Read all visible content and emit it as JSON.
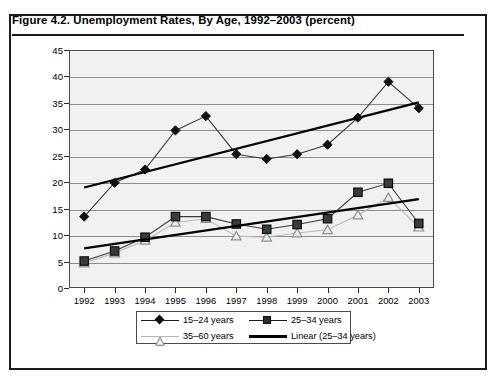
{
  "figure": {
    "caption": "Figure 4.2.  Unemployment Rates, By Age, 1992–2003 (percent)"
  },
  "chart_data": {
    "type": "line",
    "title": "Unemployment Rates, By Age, 1992–2003 (percent)",
    "xlabel": "",
    "ylabel": "",
    "ylim": [
      0,
      45
    ],
    "ytick_step": 5,
    "yticks": [
      0,
      5,
      10,
      15,
      20,
      25,
      30,
      35,
      40,
      45
    ],
    "grid": true,
    "legend_position": "bottom",
    "categories": [
      "1992",
      "1993",
      "1994",
      "1995",
      "1996",
      "1997",
      "1998",
      "1999",
      "2000",
      "2001",
      "2002",
      "2003"
    ],
    "series": [
      {
        "name": "15–24 years",
        "marker": "diamond",
        "color": "#111111",
        "values": [
          13.5,
          19.9,
          22.4,
          29.8,
          32.5,
          25.3,
          24.4,
          25.3,
          27.1,
          32.2,
          39.0,
          34.0
        ]
      },
      {
        "name": "25–34 years",
        "marker": "square",
        "color": "#2b2b2b",
        "values": [
          5.1,
          7.0,
          9.6,
          13.5,
          13.5,
          12.1,
          11.1,
          12.0,
          13.1,
          18.1,
          19.8,
          12.2
        ]
      },
      {
        "name": "35–60 years",
        "marker": "triangle",
        "color": "#b4b4b4",
        "values": [
          4.7,
          6.6,
          9.0,
          12.4,
          13.1,
          9.8,
          9.6,
          10.4,
          11.0,
          13.8,
          17.1,
          11.5
        ]
      },
      {
        "name": "Linear (25–34 years)",
        "marker": "none",
        "color": "#000000",
        "trendlines": [
          {
            "label": "upper",
            "start": 19.0,
            "end": 35.1
          },
          {
            "label": "lower",
            "start": 7.5,
            "end": 16.8
          }
        ]
      }
    ],
    "legend": [
      {
        "label": "15–24 years",
        "marker": "diamond"
      },
      {
        "label": "25–34 years",
        "marker": "square"
      },
      {
        "label": "35–60 years",
        "marker": "triangle"
      },
      {
        "label": "Linear (25–34 years)",
        "marker": "line"
      }
    ],
    "colors": {
      "plot_background": "#f2f1ef",
      "gridline": "#8d8d8d",
      "frame": "#1b1b1b"
    }
  }
}
